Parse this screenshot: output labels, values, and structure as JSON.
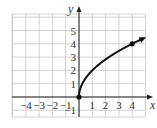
{
  "chart_data": {
    "type": "line",
    "title": "",
    "function": "y = 2*sqrt(x)",
    "xlabel": "x",
    "ylabel": "y",
    "xlim": [
      -5,
      5
    ],
    "ylim": [
      -1.5,
      6.2
    ],
    "grid": true,
    "x_ticks": [
      "-4",
      "-3",
      "-2",
      "-1",
      "1",
      "2",
      "3",
      "4"
    ],
    "y_ticks": [
      "-1",
      "1",
      "2",
      "3",
      "4",
      "5"
    ],
    "series": [
      {
        "name": "curve",
        "x": [
          0,
          0.25,
          1,
          2,
          3,
          4,
          4.9
        ],
        "y": [
          0,
          1,
          2,
          2.83,
          3.46,
          4,
          4.43
        ],
        "end_arrow": true
      }
    ],
    "points": [
      {
        "x": 0,
        "y": 0,
        "filled": true
      },
      {
        "x": 4,
        "y": 4,
        "filled": true
      }
    ],
    "colors": {
      "curve": "#111111",
      "grid": "#c8c8c8",
      "axis": "#222222"
    }
  }
}
